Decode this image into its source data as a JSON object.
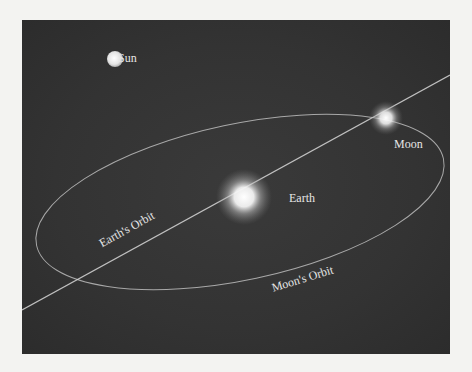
{
  "diagram": {
    "bodies": [
      {
        "id": "sun",
        "label": "Sun"
      },
      {
        "id": "earth",
        "label": "Earth"
      },
      {
        "id": "moon",
        "label": "Moon"
      }
    ],
    "paths": [
      {
        "id": "earth-orbit",
        "label": "Earth's Orbit"
      },
      {
        "id": "moon-orbit",
        "label": "Moon's Orbit"
      }
    ],
    "colors": {
      "background": "#333333",
      "page": "#f3f3f1",
      "line": "#d8d8d8",
      "text": "#e6e6e6"
    }
  }
}
